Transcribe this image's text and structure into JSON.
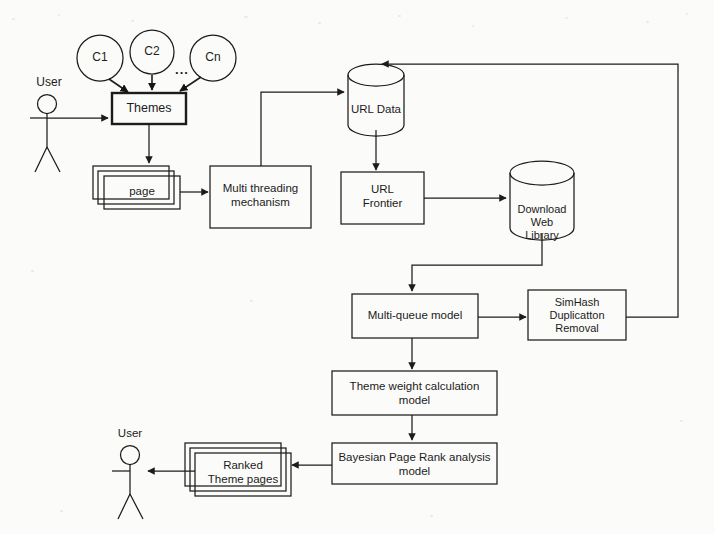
{
  "diagram": {
    "type": "flowchart",
    "style": {
      "background_color": "#fbfbf9",
      "stroke_color": "#1c1c1c",
      "text_color": "#1c1c1c"
    },
    "actors": [
      {
        "id": "user-top",
        "label": "User",
        "x": 47,
        "y": 104
      },
      {
        "id": "user-bottom",
        "label": "User",
        "x": 130,
        "y": 455
      }
    ],
    "categories": [
      {
        "id": "c1",
        "label": "C1"
      },
      {
        "id": "c2",
        "label": "C2"
      },
      {
        "id": "ellipsis",
        "label": "..."
      },
      {
        "id": "cn",
        "label": "Cn"
      }
    ],
    "nodes": [
      {
        "id": "themes",
        "label": "Themes",
        "shape": "box-bold"
      },
      {
        "id": "page-stack",
        "label": "page",
        "shape": "stacked-box"
      },
      {
        "id": "multi-threading",
        "label": "Multi threading\nmechanism",
        "shape": "box"
      },
      {
        "id": "url-data",
        "label": "URL Data",
        "shape": "cylinder"
      },
      {
        "id": "url-frontier",
        "label": "URL\nFrontier",
        "shape": "box"
      },
      {
        "id": "download-web-library",
        "label": "Download Web\nLibrary",
        "shape": "cylinder"
      },
      {
        "id": "multi-queue-model",
        "label": "Multi-queue model",
        "shape": "box"
      },
      {
        "id": "simhash-removal",
        "label": "SimHash\nDuplicatton\nRemoval",
        "shape": "box"
      },
      {
        "id": "theme-weight",
        "label": "Theme weight calculation\nmodel",
        "shape": "box"
      },
      {
        "id": "bayesian-pagerank",
        "label": "Bayesian Page Rank analysis\nmodel",
        "shape": "box"
      },
      {
        "id": "ranked-theme-pages",
        "label": "Ranked\nTheme pages",
        "shape": "stacked-box"
      }
    ],
    "edges": [
      {
        "from": "c1",
        "to": "themes"
      },
      {
        "from": "c2",
        "to": "themes"
      },
      {
        "from": "cn",
        "to": "themes"
      },
      {
        "from": "user-top",
        "to": "themes"
      },
      {
        "from": "themes",
        "to": "page-stack"
      },
      {
        "from": "page-stack",
        "to": "multi-threading"
      },
      {
        "from": "multi-threading",
        "to": "url-data"
      },
      {
        "from": "url-data",
        "to": "url-frontier"
      },
      {
        "from": "url-frontier",
        "to": "download-web-library"
      },
      {
        "from": "download-web-library",
        "to": "multi-queue-model"
      },
      {
        "from": "multi-queue-model",
        "to": "simhash-removal"
      },
      {
        "from": "simhash-removal",
        "to": "url-data"
      },
      {
        "from": "multi-queue-model",
        "to": "theme-weight"
      },
      {
        "from": "theme-weight",
        "to": "bayesian-pagerank"
      },
      {
        "from": "bayesian-pagerank",
        "to": "ranked-theme-pages"
      },
      {
        "from": "ranked-theme-pages",
        "to": "user-bottom"
      }
    ]
  }
}
